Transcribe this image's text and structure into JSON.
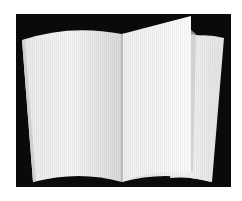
{
  "image": {
    "subject": "open blank book",
    "background_color": "#ffffff",
    "panel_color": "#0a0a0a",
    "page_color": "#f2f2f2",
    "page_shadow_color": "#cfcfcf",
    "spine_color": "#9a9a9a"
  }
}
